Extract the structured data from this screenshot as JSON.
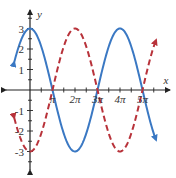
{
  "chart_data": {
    "type": "line",
    "title": "",
    "xlabel": "x",
    "ylabel": "y",
    "x_ticks": [
      {
        "value": 3.14159,
        "label": "π"
      },
      {
        "value": 6.28318,
        "label": "2π"
      },
      {
        "value": 9.42478,
        "label": "3π"
      },
      {
        "value": 12.56637,
        "label": "4π"
      },
      {
        "value": 15.70796,
        "label": "5π"
      }
    ],
    "y_ticks": [
      {
        "value": 3,
        "label": "3"
      },
      {
        "value": 2,
        "label": "2"
      },
      {
        "value": 1,
        "label": "1"
      },
      {
        "value": -1,
        "label": "-1"
      },
      {
        "value": -2,
        "label": "-2"
      },
      {
        "value": -3,
        "label": "-3"
      }
    ],
    "xlim": [
      -2.2,
      17.6
    ],
    "ylim": [
      -3.8,
      3.8
    ],
    "grid": false,
    "legend": null,
    "series": [
      {
        "name": "y = 3cos(x/2)",
        "style": "solid",
        "color": "#3a78c3",
        "domain": [
          -2.2,
          17.6
        ],
        "description": "max 3 at x=0 and 4π, min -3 at 2π, zeros at π, 3π, 5π"
      },
      {
        "name": "y = -3cos(x/2)",
        "style": "dashed",
        "color": "#b8323a",
        "domain": [
          -2.2,
          17.6
        ],
        "description": "min -3 at x=0 and 4π, max 3 at 2π, zeros at π, 3π, 5π"
      }
    ]
  },
  "axes": {
    "x_label": "x",
    "y_label": "y"
  }
}
